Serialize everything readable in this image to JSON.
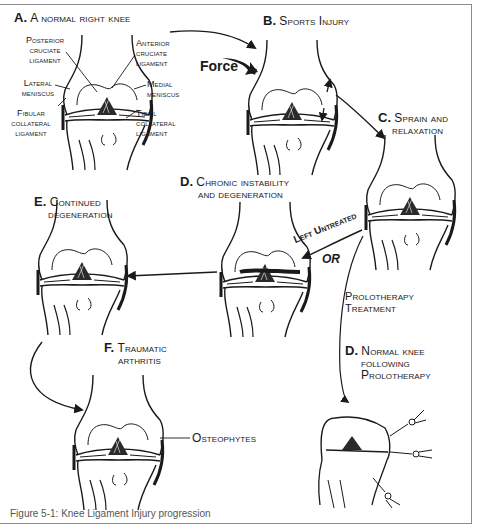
{
  "figure": {
    "panels": {
      "a": {
        "letter": "A.",
        "title": "A normal right knee"
      },
      "b": {
        "letter": "B.",
        "title": "Sports Injury"
      },
      "c": {
        "letter": "C.",
        "title_line1": "Sprain and",
        "title_line2": "relaxation"
      },
      "d_chronic": {
        "letter": "D.",
        "title_line1": "Chronic instability",
        "title_line2": "and degeneration"
      },
      "e": {
        "letter": "E.",
        "title_line1": "Continued",
        "title_line2": "degeneration"
      },
      "f": {
        "letter": "F.",
        "title_line1": "Traumatic",
        "title_line2": "arthritis"
      },
      "d_normal": {
        "letter": "D.",
        "title_line1": "Normal knee",
        "title_line2": "following",
        "title_line3": "Prolotherapy"
      }
    },
    "anatomy_labels": {
      "posterior_cruciate": [
        "Posterior",
        "cruciate",
        "ligament"
      ],
      "anterior_cruciate": [
        "Anterior",
        "cruciate",
        "ligament"
      ],
      "lateral_meniscus": [
        "Lateral",
        "meniscus"
      ],
      "medial_meniscus": [
        "Medial",
        "meniscus"
      ],
      "fibular_collateral": [
        "Fibular",
        "collateral",
        "ligament"
      ],
      "tibial_collateral": [
        "Tibial",
        "collateral",
        "ligament"
      ],
      "osteophytes": "Osteophytes"
    },
    "annotations": {
      "force": "Force",
      "left_untreated": "Left Untreated",
      "or": "OR",
      "prolotherapy_treatment_line1": "Prolotherapy",
      "prolotherapy_treatment_line2": "Treatment"
    },
    "caption": "Figure 5-1: Knee Ligament Injury progression"
  }
}
